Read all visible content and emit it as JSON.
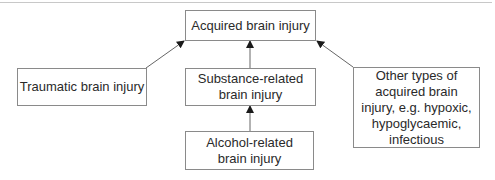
{
  "diagram": {
    "type": "hierarchy",
    "nodes": [
      {
        "id": "acquired",
        "label": "Acquired brain injury"
      },
      {
        "id": "traumatic",
        "label": "Traumatic brain injury"
      },
      {
        "id": "substance",
        "label": "Substance-related\nbrain injury"
      },
      {
        "id": "alcohol",
        "label": "Alcohol-related\nbrain injury"
      },
      {
        "id": "other",
        "label": "Other types of\nacquired brain\ninjury, e.g. hypoxic,\nhypoglycaemic,\ninfectious"
      }
    ],
    "edges": [
      {
        "from": "traumatic",
        "to": "acquired"
      },
      {
        "from": "substance",
        "to": "acquired"
      },
      {
        "from": "other",
        "to": "acquired"
      },
      {
        "from": "alcohol",
        "to": "substance"
      }
    ],
    "colors": {
      "border": "#8a8a8a",
      "arrow": "#555555",
      "text": "#2a2a2a",
      "rule": "#c8c8c8"
    }
  }
}
